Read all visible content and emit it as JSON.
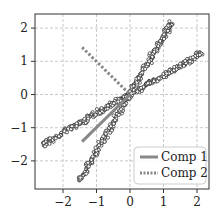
{
  "chart_data": {
    "type": "scatter",
    "title": "",
    "xlabel": "",
    "ylabel": "",
    "xlim": [
      -2.85,
      2.3
    ],
    "ylim": [
      -2.85,
      2.4
    ],
    "grid": true,
    "grid_style": "dashed",
    "x_ticks": [
      -2,
      -1,
      0,
      1,
      2
    ],
    "y_ticks": [
      -2,
      -1,
      0,
      1,
      2
    ],
    "x_tick_labels": [
      "−2",
      "−1",
      "0",
      "1",
      "2"
    ],
    "y_tick_labels": [
      "−2",
      "−1",
      "0",
      "1",
      "2"
    ],
    "scatter_clusters": [
      {
        "name": "shallow branch",
        "from": [
          -2.6,
          -1.5
        ],
        "to": [
          2.15,
          1.25
        ],
        "count": 300,
        "spread": 0.07
      },
      {
        "name": "steep branch",
        "from": [
          -1.5,
          -2.6
        ],
        "to": [
          1.25,
          2.2
        ],
        "count": 300,
        "spread": 0.07
      }
    ],
    "marker": {
      "shape": "circle",
      "facecolor": "#ffffff",
      "edgecolor": "#222222",
      "radius": 1.6
    },
    "series": [
      {
        "name": "Comp 1",
        "style": "solid",
        "color": "#888888",
        "x": [
          -1.43,
          0
        ],
        "y": [
          -1.42,
          0
        ]
      },
      {
        "name": "Comp 2",
        "style": "dotted",
        "color": "#888888",
        "x": [
          -1.43,
          0
        ],
        "y": [
          1.42,
          0
        ]
      }
    ],
    "legend": {
      "position": "lower right",
      "entries": [
        "Comp 1",
        "Comp 2"
      ]
    }
  },
  "legend": {
    "items": [
      {
        "label": "Comp 1"
      },
      {
        "label": "Comp 2"
      }
    ]
  }
}
